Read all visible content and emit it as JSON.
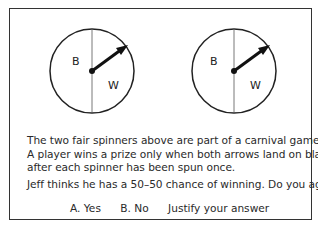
{
  "spinners": [
    {
      "left_label": "B",
      "right_label": "W",
      "arrow": "pointing upper-right into W"
    },
    {
      "left_label": "B",
      "right_label": "W",
      "arrow": "pointing upper-right into W"
    }
  ],
  "problem": {
    "line1": "The two fair spinners above are part of a carnival game.",
    "line2": "A player wins a prize only when both arrows land on black",
    "line3": "after each spinner has been spun once.",
    "question": "Jeff thinks he has a 50–50 chance of winning. Do you agree?"
  },
  "answers": {
    "option_a": "A. Yes",
    "option_b": "B. No",
    "justify": "Justify your answer"
  }
}
